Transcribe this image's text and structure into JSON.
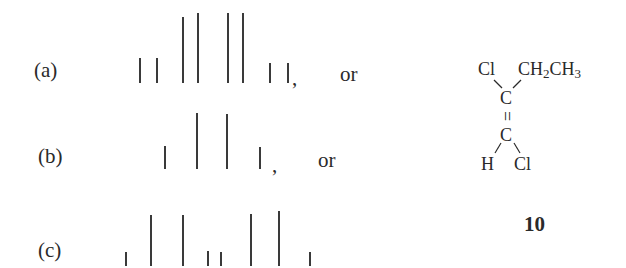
{
  "patterns": [
    {
      "label": "(a)",
      "suffix": "or",
      "baseline": 83,
      "lines": [
        {
          "x": 139,
          "top": 58
        },
        {
          "x": 156,
          "top": 58
        },
        {
          "x": 182,
          "top": 17
        },
        {
          "x": 197,
          "top": 13
        },
        {
          "x": 227,
          "top": 13
        },
        {
          "x": 242,
          "top": 13
        },
        {
          "x": 269,
          "top": 63
        },
        {
          "x": 287,
          "top": 63
        }
      ]
    },
    {
      "label": "(b)",
      "suffix": "or",
      "baseline": 169,
      "lines": [
        {
          "x": 164,
          "top": 146
        },
        {
          "x": 196,
          "top": 113
        },
        {
          "x": 226,
          "top": 114
        },
        {
          "x": 259,
          "top": 147
        }
      ]
    },
    {
      "label": "(c)",
      "suffix": "",
      "baseline": 266,
      "lines": [
        {
          "x": 125,
          "top": 252
        },
        {
          "x": 150,
          "top": 215
        },
        {
          "x": 182,
          "top": 215
        },
        {
          "x": 207,
          "top": 251
        },
        {
          "x": 220,
          "top": 252
        },
        {
          "x": 250,
          "top": 214
        },
        {
          "x": 278,
          "top": 211
        },
        {
          "x": 309,
          "top": 252
        }
      ]
    }
  ],
  "structure": {
    "top_left": "Cl",
    "top_right_main": "CH",
    "top_right_sub1": "2",
    "top_right_mid": "CH",
    "top_right_sub2": "3",
    "upper_carbon": "C",
    "double_bond": "=",
    "lower_carbon": "C",
    "bottom_left": "H",
    "bottom_right": "Cl",
    "compound_number": "10"
  },
  "colors": {
    "ink": "#2a2a2a",
    "background": "#ffffff"
  }
}
